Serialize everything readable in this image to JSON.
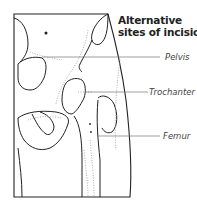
{
  "diagram": {
    "title_line1": "Alternative",
    "title_line2": "sites of incision",
    "labels": [
      {
        "text": "Pelvis"
      },
      {
        "text": "Trochanter"
      },
      {
        "text": "Femur"
      }
    ],
    "stroke_color": "#222222",
    "leader_color": "#777777",
    "stipple_color": "#999999"
  }
}
